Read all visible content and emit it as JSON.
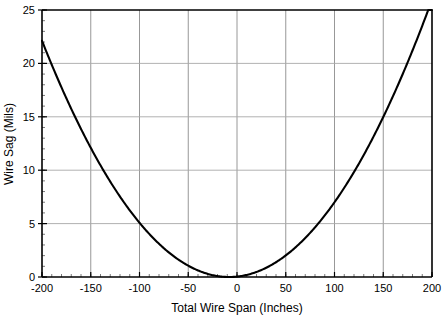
{
  "chart_data": {
    "type": "line",
    "title": "",
    "xlabel": "Total Wire Span (Inches)",
    "ylabel": "Wire Sag (Mils)",
    "xlim": [
      -200,
      200
    ],
    "ylim": [
      0,
      25
    ],
    "grid": true,
    "legend": false,
    "x_ticks": [
      -200,
      -150,
      -100,
      -50,
      0,
      50,
      100,
      150,
      200
    ],
    "x_tick_labels": [
      "-200",
      "-150",
      "-100",
      "-50",
      "0",
      "50",
      "100",
      "150",
      "200"
    ],
    "x_minor_step": 10,
    "y_ticks": [
      0,
      5,
      10,
      15,
      20,
      25
    ],
    "y_tick_labels": [
      "0",
      "5",
      "10",
      "15",
      "20",
      "25"
    ],
    "y_minor_step": 1,
    "series": [
      {
        "name": "Wire Sag",
        "color": "#000000",
        "x": [
          -200,
          -190,
          -180,
          -170,
          -160,
          -150,
          -140,
          -130,
          -120,
          -110,
          -100,
          -90,
          -80,
          -70,
          -60,
          -50,
          -40,
          -30,
          -20,
          -10,
          0,
          10,
          20,
          30,
          40,
          50,
          60,
          70,
          80,
          90,
          100,
          110,
          120,
          130,
          140,
          150,
          160,
          170,
          180,
          190,
          200
        ],
        "y": [
          24.3,
          22.1,
          19.9,
          17.9,
          16.0,
          14.2,
          12.5,
          10.9,
          9.4,
          8.0,
          6.8,
          5.6,
          4.6,
          3.6,
          2.8,
          2.1,
          1.5,
          1.0,
          0.6,
          0.3,
          0.1,
          0.0,
          0.1,
          0.3,
          0.6,
          1.0,
          1.5,
          2.1,
          2.8,
          3.6,
          4.6,
          5.6,
          6.8,
          8.0,
          9.4,
          10.9,
          12.5,
          14.2,
          16.0,
          17.9,
          19.9
        ],
        "equation_vertex_x": -8,
        "equation_coefficient": 0.0006
      }
    ]
  },
  "labels": {
    "x_axis_title": "Total Wire Span (Inches)",
    "y_axis_title": "Wire Sag (Mils)"
  }
}
